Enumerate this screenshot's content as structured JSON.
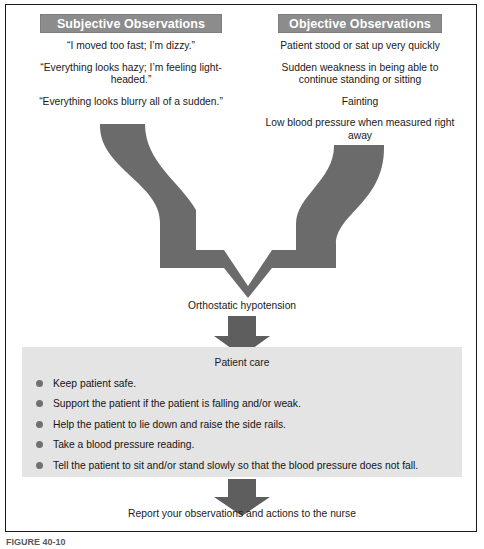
{
  "figure": {
    "caption": "FIGURE 40-10",
    "colors": {
      "header_bg": "#8c8c8c",
      "header_text": "#ffffff",
      "arrow_fill": "#6b6b6b",
      "panel_bg": "#e4e4e4",
      "bullet": "#707070",
      "frame_border": "#1b1b1b",
      "body_text": "#1a1a1a"
    }
  },
  "columns": {
    "subjective": {
      "header": "Subjective Observations",
      "items": [
        "“I moved too fast; I’m dizzy.”",
        "“Everything looks hazy; I’m feeling light-headed.”",
        "“Everything looks blurry all of a sudden.”"
      ]
    },
    "objective": {
      "header": "Objective Observations",
      "items": [
        "Patient stood or sat up very quickly",
        "Sudden weakness in being able to continue standing or sitting",
        "Fainting",
        "Low blood pressure when measured right away"
      ]
    }
  },
  "flow": {
    "diagnosis_label": "Orthostatic hypotension",
    "care_heading": "Patient care",
    "care_items": [
      "Keep patient safe.",
      "Support the patient if the patient is falling and/or weak.",
      "Help the patient to lie down and raise the side rails.",
      "Take a blood pressure reading.",
      "Tell the patient to sit and/or stand slowly so that the blood pressure does not fall."
    ],
    "report_label": "Report your observations and actions to the nurse"
  }
}
